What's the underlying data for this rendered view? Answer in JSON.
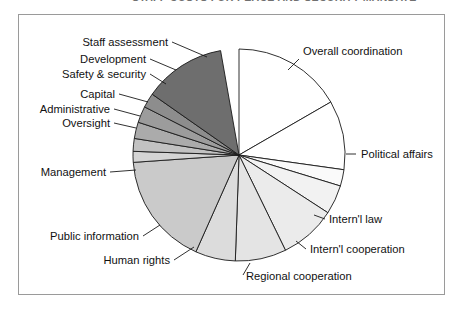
{
  "header": {
    "running_title": "STAFF COSTS FOR PEACE AND SECURITY MANDATE"
  },
  "figure": {
    "frame_color": "#9a9a9a",
    "background": "#ffffff",
    "outline_color": "#1a1a1a"
  },
  "chart_data": {
    "type": "pie",
    "title": "",
    "xlabel": "",
    "ylabel": "",
    "legend_position": "none",
    "grid": false,
    "start_angle_deg": 0,
    "direction": "clockwise",
    "center": {
      "x": 239,
      "y": 155
    },
    "radius": 106,
    "categories": [
      "Overall coordination",
      "Political affairs",
      "Intern'l law",
      "Intern'l cooperation",
      "Regional cooperation",
      "Human rights",
      "Public information",
      "Management",
      "Oversight",
      "Administrative",
      "Capital",
      "Safety & security",
      "Development",
      "Staff assessment"
    ],
    "values": [
      16.7,
      10.6,
      2.5,
      4.4,
      8.6,
      7.8,
      6.1,
      17.2,
      1.7,
      1.9,
      2.5,
      2.5,
      2.2,
      12.5
    ],
    "angles_deg": [
      60.0,
      38.0,
      9.0,
      16.0,
      31.0,
      28.0,
      22.0,
      62.0,
      6.0,
      7.0,
      9.0,
      9.0,
      8.0,
      45.0
    ],
    "colors": [
      "#ffffff",
      "#ffffff",
      "#fafafa",
      "#f2f2f2",
      "#ebebeb",
      "#e4e4e4",
      "#dcdcdc",
      "#cacaca",
      "#d4d4d4",
      "#c2c2c2",
      "#ababab",
      "#9c9c9c",
      "#8d8d8d",
      "#6e6e6e"
    ]
  },
  "labels": [
    {
      "text": "Staff assessment",
      "x": 168,
      "y": 46,
      "anchor": "end",
      "leader": [
        [
          172,
          42
        ],
        [
          207,
          57
        ]
      ]
    },
    {
      "text": "Development",
      "x": 146,
      "y": 63,
      "anchor": "end",
      "leader": [
        [
          150,
          59
        ],
        [
          176,
          70
        ]
      ]
    },
    {
      "text": "Safety & security",
      "x": 146,
      "y": 78,
      "anchor": "end",
      "leader": [
        [
          150,
          74
        ],
        [
          166,
          84
        ]
      ]
    },
    {
      "text": "Capital",
      "x": 115,
      "y": 98,
      "anchor": "end",
      "leader": [
        [
          119,
          94
        ],
        [
          148,
          102
        ]
      ]
    },
    {
      "text": "Administrative",
      "x": 110,
      "y": 113,
      "anchor": "end",
      "leader": [
        [
          114,
          109
        ],
        [
          140,
          116
        ]
      ]
    },
    {
      "text": "Oversight",
      "x": 110,
      "y": 127,
      "anchor": "end",
      "leader": [
        [
          114,
          123
        ],
        [
          136,
          128
        ]
      ]
    },
    {
      "text": "Management",
      "x": 106,
      "y": 176,
      "anchor": "end",
      "leader": [
        [
          110,
          172
        ],
        [
          136,
          170
        ]
      ]
    },
    {
      "text": "Public information",
      "x": 139,
      "y": 240,
      "anchor": "end",
      "leader": [
        [
          143,
          236
        ],
        [
          160,
          225
        ]
      ]
    },
    {
      "text": "Human rights",
      "x": 170,
      "y": 264,
      "anchor": "end",
      "leader": [
        [
          174,
          260
        ],
        [
          194,
          247
        ]
      ]
    },
    {
      "text": "Regional cooperation",
      "x": 246,
      "y": 280,
      "anchor": "start",
      "leader": [
        [
          243,
          275
        ],
        [
          250,
          263
        ]
      ]
    },
    {
      "text": "Intern'l cooperation",
      "x": 310,
      "y": 253,
      "anchor": "start",
      "leader": [
        [
          306,
          249
        ],
        [
          296,
          241
        ]
      ]
    },
    {
      "text": "Intern'l law",
      "x": 329,
      "y": 223,
      "anchor": "start",
      "leader": [
        [
          325,
          219
        ],
        [
          314,
          215
        ]
      ]
    },
    {
      "text": "Political affairs",
      "x": 361,
      "y": 158,
      "anchor": "start",
      "leader": [
        [
          346,
          154
        ],
        [
          356,
          154
        ]
      ]
    },
    {
      "text": "Overall coordination",
      "x": 303,
      "y": 55,
      "anchor": "start",
      "leader": [
        [
          299,
          59
        ],
        [
          288,
          70
        ]
      ]
    }
  ]
}
